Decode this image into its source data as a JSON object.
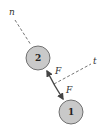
{
  "diagram": {
    "axes": {
      "normal_label": "n",
      "tangent_label": "t"
    },
    "balls": [
      {
        "id": "ball-2",
        "label": "2",
        "cx": 38,
        "cy": 58,
        "r": 12,
        "fill": "#c9c9c9"
      },
      {
        "id": "ball-1",
        "label": "1",
        "cx": 71,
        "cy": 112,
        "r": 12,
        "fill": "#c9c9c9"
      }
    ],
    "forces": {
      "upper_label": "F",
      "lower_label": "F"
    }
  }
}
